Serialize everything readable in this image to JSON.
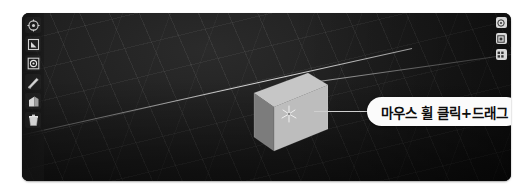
{
  "viewport": {
    "background_color": "#1a1a1a",
    "grid_color": "#8c8c8c",
    "axis_line_color": "#e1e1e1"
  },
  "left_toolbar": {
    "items": [
      {
        "icon": "orbit-target-icon",
        "label": "Orbit"
      },
      {
        "icon": "square-select-icon",
        "label": "Select"
      },
      {
        "icon": "circle-in-square-icon",
        "label": "Snap"
      },
      {
        "icon": "pen-line-icon",
        "label": "Line"
      },
      {
        "icon": "polygon-shape-icon",
        "label": "Shape"
      },
      {
        "icon": "trash-bin-icon",
        "label": "Delete"
      }
    ]
  },
  "right_strip": {
    "items": [
      {
        "icon": "view-top-icon",
        "label": "Top view"
      },
      {
        "icon": "view-front-icon",
        "label": "Front view"
      },
      {
        "icon": "grid-settings-icon",
        "label": "Grid settings"
      }
    ]
  },
  "cube": {
    "front_face_color": "#b9b9b9",
    "left_face_color": "#7c7c7c",
    "top_face_color": "#c6c6c6"
  },
  "gizmo": {
    "icon": "axis-gizmo-icon",
    "color": "#d9d9d9"
  },
  "callout": {
    "text": "마우스 휠 클릭+드래그",
    "background_color": "#fbfbfb",
    "text_color": "#0d0d0d",
    "leader_line_color": "#cfcfcf"
  }
}
